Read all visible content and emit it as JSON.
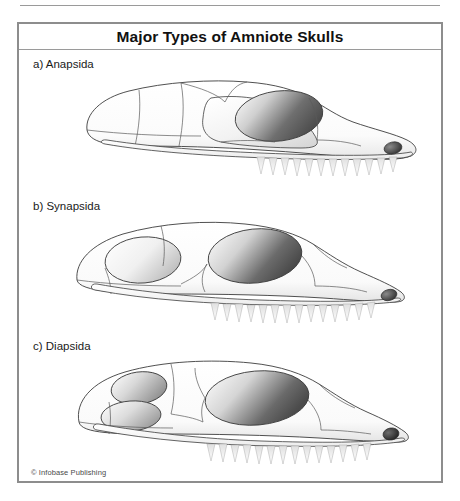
{
  "figure": {
    "title": "Major Types of Amniote Skulls",
    "credit": "© Infobase Publishing",
    "border_color": "#8d8d8d",
    "rule_color": "#9a9a9a",
    "ink_color": "#3c3c3c",
    "shade_color": "#6e6e6e"
  },
  "skulls": [
    {
      "id": "anapsida",
      "label": "a) Anapsida",
      "letter": "a",
      "name": "Anapsida",
      "fenestrae_count": 0,
      "openings": [
        "orbit",
        "naris"
      ],
      "description": "Skull roof with no temporal fenestrae behind the orbit"
    },
    {
      "id": "synapsida",
      "label": "b) Synapsida",
      "letter": "b",
      "name": "Synapsida",
      "fenestrae_count": 1,
      "openings": [
        "lower temporal fenestra",
        "orbit",
        "naris"
      ],
      "description": "Single lower temporal fenestra behind the orbit"
    },
    {
      "id": "diapsida",
      "label": "c) Diapsida",
      "letter": "c",
      "name": "Diapsida",
      "fenestrae_count": 2,
      "openings": [
        "upper temporal fenestra",
        "lower temporal fenestra",
        "orbit",
        "naris"
      ],
      "description": "Upper and lower temporal fenestrae behind the orbit"
    }
  ]
}
